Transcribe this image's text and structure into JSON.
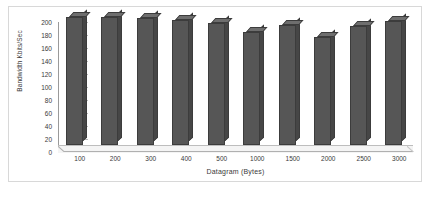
{
  "chart_data": {
    "type": "bar",
    "title": "",
    "subtitle": "",
    "xlabel": "Datagram (Bytes)",
    "ylabel": "Bandwidth Kbits/Sec",
    "categories": [
      "100",
      "200",
      "300",
      "400",
      "500",
      "1000",
      "1500",
      "2000",
      "2500",
      "3000"
    ],
    "values": [
      200,
      200,
      199,
      195,
      190,
      176,
      188,
      169,
      186,
      193
    ],
    "ylim": [
      0,
      200
    ],
    "yticks": [
      0,
      20,
      40,
      60,
      80,
      100,
      120,
      140,
      160,
      180,
      200
    ],
    "ytick_labels": [
      "0",
      "20",
      "40",
      "60",
      "80",
      "100",
      "120",
      "140",
      "160",
      "180",
      "200"
    ],
    "grid": false,
    "legend": null,
    "legend_position": "none",
    "style": "3d-column",
    "series": [
      {
        "name": "Bandwidth",
        "values": [
          200,
          200,
          199,
          195,
          190,
          176,
          188,
          169,
          186,
          193
        ]
      }
    ],
    "colors": {
      "bar_face": "#565656",
      "bar_top": "#6e6e6e",
      "bar_side": "#464646",
      "bar_outline": "#3c3c3c",
      "axis": "#9a9a9a",
      "floor": "#f4f4f4",
      "text": "#3a3a3a",
      "frame": "#d8d8d8",
      "background": "#ffffff"
    }
  }
}
